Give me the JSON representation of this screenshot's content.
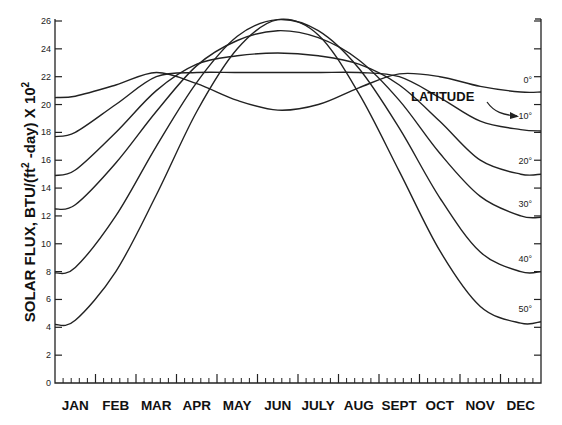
{
  "caption_cutoff": "... (caption partially cut off at top)",
  "chart_data": {
    "type": "line",
    "title": "",
    "xlabel": "",
    "ylabel": "SOLAR FLUX, BTU/(ft² -day) X 10²",
    "ylabel_parts": {
      "main": "SOLAR FLUX, BTU/(ft",
      "sup1": "2",
      "mid": " -day) X 10",
      "sup2": "2"
    },
    "ylim": [
      0,
      26
    ],
    "yticks": [
      0,
      2,
      4,
      6,
      8,
      10,
      12,
      14,
      16,
      18,
      20,
      22,
      24,
      26
    ],
    "categories": [
      "JAN",
      "FEB",
      "MAR",
      "APR",
      "MAY",
      "JUN",
      "JULY",
      "AUG",
      "SEPT",
      "OCT",
      "NOV",
      "DEC"
    ],
    "legend_title": "LATITUDE",
    "legend_position": "right, inline curve labels",
    "grid": false,
    "x_note": "values at mid-month; start (Jan 1) and end (Dec 31) values given separately",
    "series": [
      {
        "name": "0°",
        "label": "0°",
        "start": 20.5,
        "values": [
          20.6,
          21.4,
          22.3,
          21.5,
          20.3,
          19.6,
          20.0,
          21.2,
          22.2,
          22.0,
          21.3,
          20.9
        ],
        "end": 20.9
      },
      {
        "name": "10°",
        "label": "10°",
        "start": 17.7,
        "values": [
          18.0,
          20.0,
          22.0,
          22.3,
          22.3,
          22.3,
          22.3,
          22.3,
          22.0,
          20.5,
          18.8,
          18.2
        ],
        "end": 18.1
      },
      {
        "name": "20°",
        "label": "20°",
        "start": 14.9,
        "values": [
          15.3,
          18.0,
          21.0,
          22.9,
          23.5,
          23.7,
          23.5,
          22.9,
          21.4,
          18.8,
          16.0,
          15.0
        ],
        "end": 15.0
      },
      {
        "name": "30°",
        "label": "30°",
        "start": 12.5,
        "values": [
          12.8,
          15.8,
          19.5,
          22.8,
          24.6,
          25.3,
          24.8,
          23.2,
          20.3,
          16.5,
          13.4,
          12.0
        ],
        "end": 11.9
      },
      {
        "name": "40°",
        "label": "40°",
        "start": 7.9,
        "values": [
          8.3,
          12.0,
          17.0,
          21.6,
          24.9,
          26.1,
          25.3,
          22.6,
          18.3,
          13.3,
          9.4,
          8.0
        ],
        "end": 8.0
      },
      {
        "name": "50°",
        "label": "50°",
        "start": 4.2,
        "values": [
          4.5,
          8.0,
          13.5,
          19.5,
          24.0,
          26.1,
          25.0,
          20.8,
          15.2,
          9.5,
          5.5,
          4.3
        ],
        "end": 4.4
      }
    ]
  },
  "colors": {
    "line": "#222222",
    "background": "#ffffff",
    "text": "#111111"
  }
}
